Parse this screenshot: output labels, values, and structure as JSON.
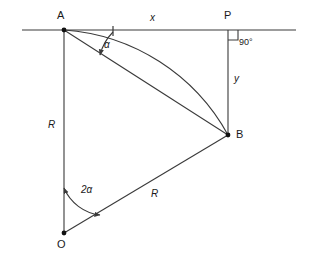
{
  "diagram": {
    "colors": {
      "line": "#3a3a3a",
      "point": "#111111",
      "text": "#1a1a1a",
      "background": "#ffffff"
    },
    "points": [
      {
        "id": "A",
        "label": "A",
        "x": 64,
        "y": 30,
        "label_x": 57,
        "label_y": 10
      },
      {
        "id": "P",
        "label": "P",
        "x": 228,
        "y": 30,
        "label_x": 224,
        "label_y": 10
      },
      {
        "id": "B",
        "label": "B",
        "x": 228,
        "y": 135,
        "label_x": 236,
        "label_y": 129
      },
      {
        "id": "O",
        "label": "O",
        "x": 64,
        "y": 233,
        "label_x": 57,
        "label_y": 239
      }
    ],
    "segment_labels": [
      {
        "id": "x",
        "label": "x",
        "x": 150,
        "y": 13,
        "desc": "horizontal distance A to P"
      },
      {
        "id": "y",
        "label": "y",
        "x": 234,
        "y": 74,
        "desc": "vertical distance P to B"
      },
      {
        "id": "R-left",
        "label": "R",
        "x": 48,
        "y": 120,
        "desc": "radius O to A"
      },
      {
        "id": "R-diag",
        "label": "R",
        "x": 151,
        "y": 189,
        "desc": "radius O to B"
      }
    ],
    "angles": [
      {
        "id": "alpha",
        "label": "α",
        "x": 104,
        "y": 40,
        "desc": "angle at A between horizontal and chord AB"
      },
      {
        "id": "two-alpha",
        "label": "2α",
        "x": 81,
        "y": 185,
        "desc": "central angle at O between OA and OB"
      },
      {
        "id": "right-angle",
        "label": "90°",
        "x": 239,
        "y": 38,
        "desc": "right angle at P"
      }
    ],
    "elements": {
      "horizontal_line": "horizontal-baseline",
      "chord": "chord-a-b",
      "arc": "arc-a-b",
      "radius_oa": "radius-o-a",
      "radius_ob": "radius-o-b",
      "vertical_pb": "vertical-p-b",
      "right_angle_marker": "right-angle-marker",
      "alpha_arc": "alpha-angle-arc",
      "two_alpha_arc": "two-alpha-angle-arc"
    }
  }
}
